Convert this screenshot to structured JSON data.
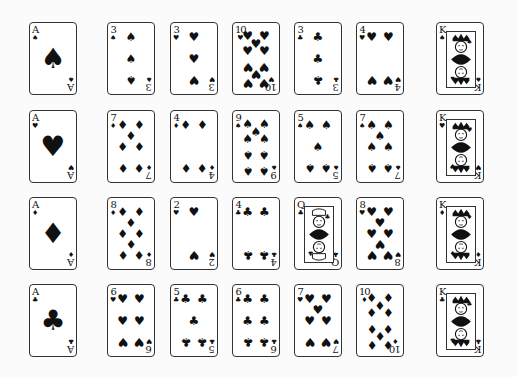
{
  "layout": {
    "columns_x": [
      29,
      107,
      170,
      232,
      294,
      356,
      436
    ],
    "rows_y": [
      22,
      110,
      197,
      284
    ]
  },
  "rows": [
    [
      {
        "rank": "A",
        "suit": "spades",
        "symbol": "♠"
      },
      {
        "rank": "3",
        "suit": "spades",
        "symbol": "♠"
      },
      {
        "rank": "3",
        "suit": "hearts",
        "symbol": "♥"
      },
      {
        "rank": "10",
        "suit": "hearts",
        "symbol": "♥"
      },
      {
        "rank": "3",
        "suit": "clubs",
        "symbol": "♣"
      },
      {
        "rank": "4",
        "suit": "hearts",
        "symbol": "♥"
      },
      {
        "rank": "K",
        "suit": "spades",
        "symbol": "♠"
      }
    ],
    [
      {
        "rank": "A",
        "suit": "hearts",
        "symbol": "♥"
      },
      {
        "rank": "7",
        "suit": "diamonds",
        "symbol": "♦"
      },
      {
        "rank": "4",
        "suit": "diamonds",
        "symbol": "♦"
      },
      {
        "rank": "9",
        "suit": "spades",
        "symbol": "♠"
      },
      {
        "rank": "5",
        "suit": "spades",
        "symbol": "♠"
      },
      {
        "rank": "7",
        "suit": "spades",
        "symbol": "♠"
      },
      {
        "rank": "K",
        "suit": "hearts",
        "symbol": "♥"
      }
    ],
    [
      {
        "rank": "A",
        "suit": "diamonds",
        "symbol": "♦"
      },
      {
        "rank": "8",
        "suit": "diamonds",
        "symbol": "♦"
      },
      {
        "rank": "2",
        "suit": "hearts",
        "symbol": "♥"
      },
      {
        "rank": "4",
        "suit": "clubs",
        "symbol": "♣"
      },
      {
        "rank": "Q",
        "suit": "clubs",
        "symbol": "♣"
      },
      {
        "rank": "8",
        "suit": "hearts",
        "symbol": "♥"
      },
      {
        "rank": "K",
        "suit": "diamonds",
        "symbol": "♦"
      }
    ],
    [
      {
        "rank": "A",
        "suit": "clubs",
        "symbol": "♣"
      },
      {
        "rank": "6",
        "suit": "hearts",
        "symbol": "♥"
      },
      {
        "rank": "5",
        "suit": "clubs",
        "symbol": "♣"
      },
      {
        "rank": "6",
        "suit": "clubs",
        "symbol": "♣"
      },
      {
        "rank": "7",
        "suit": "hearts",
        "symbol": "♥"
      },
      {
        "rank": "10",
        "suit": "diamonds",
        "symbol": "♦"
      },
      {
        "rank": "K",
        "suit": "clubs",
        "symbol": "♣"
      }
    ]
  ],
  "colors": {
    "ink": "#111111",
    "background": "#fbfbfb",
    "card": "#ffffff"
  }
}
